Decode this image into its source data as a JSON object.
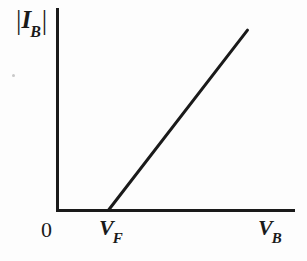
{
  "figure": {
    "kind": "line-plot",
    "background_color": "#fdfdfd",
    "ink_color": "#1a1a1a",
    "y_axis_label": {
      "open_bar": "|",
      "symbol": "I",
      "subscript": "B",
      "close_bar": "|",
      "plain": "|I_B|"
    },
    "ticks": {
      "origin": "0",
      "forward_voltage": {
        "symbol": "V",
        "subscript": "F",
        "plain": "V_F"
      },
      "breakdown_voltage": {
        "symbol": "V",
        "subscript": "B",
        "plain": "V_B"
      }
    }
  },
  "chart_data": {
    "type": "line",
    "title": "",
    "xlabel": "V_B",
    "ylabel": "|I_B|",
    "grid": false,
    "legend": null,
    "axis_style": "open-corner",
    "xlim": [
      0,
      1
    ],
    "ylim": [
      0,
      1
    ],
    "x_tick_labels": [
      "0",
      "V_F",
      "V_B"
    ],
    "x_tick_positions": [
      0.0,
      0.215,
      0.855
    ],
    "y_tick_labels": [],
    "series": [
      {
        "name": "|I_B| vs V_B",
        "x": [
          0.0,
          0.215,
          0.8
        ],
        "y": [
          0.0,
          0.0,
          0.89
        ],
        "segments": [
          {
            "from": [
              0.0,
              0.0
            ],
            "to": [
              0.215,
              0.0
            ],
            "drawn": false
          },
          {
            "from": [
              0.215,
              0.0
            ],
            "to": [
              0.8,
              0.89
            ],
            "drawn": true
          }
        ],
        "linewidth_px": 3,
        "color": "#1a1a1a"
      }
    ]
  }
}
